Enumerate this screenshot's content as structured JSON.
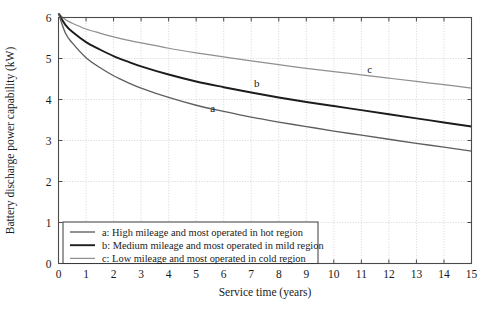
{
  "chart_data": {
    "type": "line",
    "title": "",
    "xlabel": "Service time (years)",
    "ylabel": "Battery discharge power capability (kW)",
    "xlim": [
      0,
      15
    ],
    "ylim": [
      0,
      6
    ],
    "xticks": [
      "0",
      "1",
      "2",
      "3",
      "4",
      "5",
      "6",
      "7",
      "8",
      "9",
      "10",
      "11",
      "12",
      "13",
      "14",
      "15"
    ],
    "yticks": [
      "0",
      "1",
      "2",
      "3",
      "4",
      "5",
      "6"
    ],
    "grid": true,
    "legend_position": "lower left inside axes",
    "x": [
      0,
      0.25,
      0.5,
      1,
      1.5,
      2,
      2.5,
      3,
      4,
      5,
      6,
      7,
      8,
      9,
      10,
      11,
      12,
      13,
      14,
      15
    ],
    "series": [
      {
        "name": "a",
        "legend": "a: High mileage and most operated in hot region",
        "color": "#5e5e5e",
        "label_text": "a",
        "values": [
          6.1,
          5.62,
          5.38,
          5.02,
          4.78,
          4.58,
          4.42,
          4.28,
          4.05,
          3.86,
          3.71,
          3.57,
          3.45,
          3.34,
          3.23,
          3.13,
          3.03,
          2.93,
          2.84,
          2.74
        ]
      },
      {
        "name": "b",
        "legend": "b: Medium mileage and most operated in mild region",
        "color": "#1c1c1c",
        "label_text": "b",
        "values": [
          6.1,
          5.82,
          5.65,
          5.4,
          5.22,
          5.06,
          4.93,
          4.81,
          4.61,
          4.44,
          4.3,
          4.17,
          4.05,
          3.94,
          3.84,
          3.74,
          3.64,
          3.54,
          3.44,
          3.34
        ]
      },
      {
        "name": "c",
        "legend": "c: Low mileage and most operated in cold region",
        "color": "#8f8f8f",
        "label_text": "c",
        "values": [
          6.1,
          5.95,
          5.86,
          5.72,
          5.62,
          5.53,
          5.45,
          5.38,
          5.25,
          5.14,
          5.04,
          4.94,
          4.85,
          4.76,
          4.68,
          4.6,
          4.52,
          4.44,
          4.36,
          4.28
        ]
      }
    ],
    "annotations": [
      {
        "text": "a",
        "x": 5.6,
        "y": 3.7
      },
      {
        "text": "b",
        "x": 7.2,
        "y": 4.3
      },
      {
        "text": "c",
        "x": 11.3,
        "y": 4.65
      }
    ]
  }
}
